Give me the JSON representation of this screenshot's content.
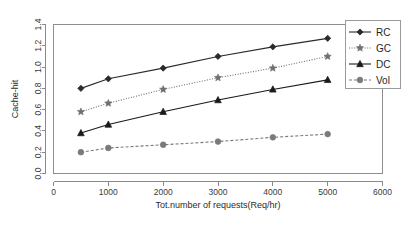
{
  "chart_data": {
    "type": "line",
    "title": "",
    "xlabel": "Tot.number of requests(Req/hr)",
    "ylabel": "Cache-hit",
    "xlim": [
      0,
      6000
    ],
    "ylim": [
      0.0,
      1.4
    ],
    "xticks": [
      0,
      1000,
      2000,
      3000,
      4000,
      5000,
      6000
    ],
    "xticklabels": [
      "0",
      "1000",
      "2000",
      "3000",
      "4000",
      "5000",
      "6000"
    ],
    "yticks": [
      0.0,
      0.2,
      0.4,
      0.6,
      0.8,
      1.0,
      1.2,
      1.4
    ],
    "yticklabels": [
      "0.0",
      "0.2",
      "0.4",
      "0.6",
      "0.8",
      "1.0",
      "1.2",
      "1.4"
    ],
    "grid": false,
    "legend_position": "top-right",
    "x": [
      500,
      1000,
      2000,
      3000,
      4000,
      5000
    ],
    "series": [
      {
        "name": "RC",
        "values": [
          0.8,
          0.89,
          0.99,
          1.1,
          1.19,
          1.27
        ],
        "marker": "diamond",
        "linestyle": "solid",
        "color": "#2a2a2a"
      },
      {
        "name": "GC",
        "values": [
          0.58,
          0.66,
          0.79,
          0.9,
          0.99,
          1.1
        ],
        "marker": "star",
        "linestyle": "dotted",
        "color": "#6f6f6f"
      },
      {
        "name": "DC",
        "values": [
          0.38,
          0.46,
          0.58,
          0.69,
          0.79,
          0.88
        ],
        "marker": "triangle",
        "linestyle": "solid",
        "color": "#1a1a1a"
      },
      {
        "name": "Vol",
        "values": [
          0.2,
          0.24,
          0.27,
          0.3,
          0.34,
          0.37
        ],
        "marker": "circle",
        "linestyle": "dashed",
        "color": "#7a7a7a"
      }
    ]
  },
  "legend": {
    "entries": [
      {
        "label": "RC"
      },
      {
        "label": "GC"
      },
      {
        "label": "DC"
      },
      {
        "label": "Vol"
      }
    ]
  }
}
